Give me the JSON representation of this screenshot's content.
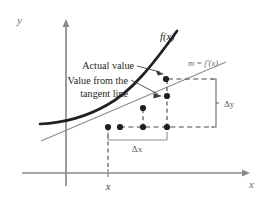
{
  "figure": {
    "title_semantic": "derivative-tangent-line-approximation-diagram",
    "background_color": "#ffffff",
    "axes": {
      "y_axis_label": "y",
      "x_axis_label": "x",
      "axis_color": "#8a8a8a",
      "origin_px": [
        66,
        173
      ],
      "y_axis_top_px": [
        66,
        22
      ],
      "x_axis_right_px": [
        248,
        173
      ]
    },
    "curve": {
      "label": "f(x)",
      "color": "#231f20",
      "stroke_width": 2.6,
      "path": "M 40,124 C 62,122 86,116 108,104 C 130,92 152,68 176,34"
    },
    "tangent_line": {
      "label": "m = f'(x)",
      "color": "#8d8d8d",
      "stroke_width": 1.1,
      "from_px": [
        41,
        140
      ],
      "to_px": [
        225,
        62
      ]
    },
    "callouts": [
      {
        "name": "actual-value",
        "text": "Actual value"
      },
      {
        "name": "value-from-tangent-line-line1",
        "text": "Value from the"
      },
      {
        "name": "value-from-tangent-line-line2",
        "text": "tangent line"
      }
    ],
    "deltas": {
      "delta_y": "Δy",
      "delta_x": "Δx"
    },
    "tick_label_x": "x",
    "points": [
      {
        "name": "point-tangency-on-curve",
        "x": 108,
        "y": 127
      },
      {
        "name": "point-tangency-on-tangent",
        "x": 119,
        "y": 127
      },
      {
        "name": "point-base-mid",
        "x": 143,
        "y": 127
      },
      {
        "name": "point-base-right",
        "x": 167,
        "y": 127
      },
      {
        "name": "point-mid-on-tangent",
        "x": 143,
        "y": 110
      },
      {
        "name": "point-tangent-value",
        "x": 167,
        "y": 96
      },
      {
        "name": "point-actual-value",
        "x": 166,
        "y": 79
      }
    ],
    "point_color": "#231f20",
    "point_radius": 3.0,
    "dashes": {
      "color": "#4b4b4b",
      "vertical_from_x_axis": {
        "x": 108,
        "y_top": 127,
        "y_bottom": 169
      },
      "horizontal_base": {
        "y": 127,
        "x_left": 119,
        "x_right": 214
      },
      "horizontal_top": {
        "y": 79,
        "x_left": 167,
        "x_right": 214
      },
      "vertical_mid": {
        "x": 143,
        "y_top": 110,
        "y_bottom": 127
      },
      "vertical_right": {
        "x": 167,
        "y_top": 79,
        "y_bottom": 127
      }
    },
    "brackets": {
      "delta_y_bracket_color": "#6a6a6a",
      "delta_x_bracket_color": "#8d8d8d"
    }
  }
}
